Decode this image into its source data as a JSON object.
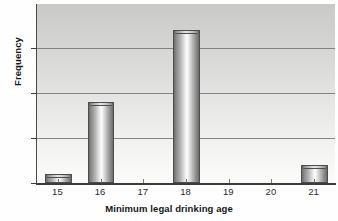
{
  "chart_data": {
    "type": "bar",
    "title": "",
    "xlabel": "Minimum legal drinking age",
    "ylabel": "Frequency",
    "categories": [
      "15",
      "16",
      "17",
      "18",
      "19",
      "20",
      "21"
    ],
    "values": [
      1,
      9,
      0,
      17,
      0,
      0,
      2
    ],
    "series": [
      {
        "name": "Frequency",
        "values": [
          1,
          9,
          0,
          17,
          0,
          0,
          2
        ]
      }
    ],
    "xlim": [
      14.5,
      21.5
    ],
    "ylim": [
      0,
      19.9
    ],
    "yticks": [
      "0",
      "5",
      "10",
      "15"
    ],
    "ytick_values": [
      0,
      5,
      10,
      15
    ],
    "xticks": [
      "15",
      "16",
      "17",
      "18",
      "19",
      "20",
      "21"
    ],
    "grid": "horizontal",
    "legend": "none",
    "bar_style": "cylinder-3d",
    "colors": {
      "bar_fill": "#b8b8b8",
      "bar_edge": "#4d4d4d",
      "plot_background_top": "#c9c9c7",
      "plot_background_bottom": "#fbfbf9",
      "gridline": "#6f6f6f",
      "axis": "#3c3c3c",
      "text": "#2a2c2f"
    }
  },
  "axes": {
    "y_title": "Frequency",
    "x_title": "Minimum legal drinking age",
    "y_ticks": [
      {
        "label": "15",
        "value": 15
      },
      {
        "label": "10",
        "value": 10
      },
      {
        "label": "5",
        "value": 5
      },
      {
        "label": "0",
        "value": 0
      }
    ],
    "x_ticks": [
      {
        "label": "15",
        "value": 1
      },
      {
        "label": "16",
        "value": 9
      },
      {
        "label": "17",
        "value": 0
      },
      {
        "label": "18",
        "value": 17
      },
      {
        "label": "19",
        "value": 0
      },
      {
        "label": "20",
        "value": 0
      },
      {
        "label": "21",
        "value": 2
      }
    ]
  }
}
